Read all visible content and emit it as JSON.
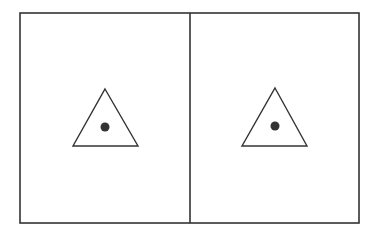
{
  "diagram": {
    "colors": {
      "stroke": "#333333",
      "fill": "#ffffff",
      "dot": "#333333"
    },
    "frame": {
      "x": 20,
      "y": 13,
      "width": 339,
      "height": 210
    },
    "divider_x": 190,
    "panels": [
      {
        "label": "left-panel",
        "triangle": {
          "apex": [
            105,
            89
          ],
          "base_left": [
            73,
            146
          ],
          "base_right": [
            138,
            146
          ]
        },
        "dot": {
          "cx": 105,
          "cy": 127,
          "r": 4.5
        }
      },
      {
        "label": "right-panel",
        "triangle": {
          "apex": [
            275,
            88
          ],
          "base_left": [
            242,
            146
          ],
          "base_right": [
            307,
            146
          ]
        },
        "dot": {
          "cx": 275,
          "cy": 126,
          "r": 4.5
        }
      }
    ]
  }
}
